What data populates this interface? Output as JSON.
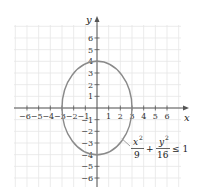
{
  "chart_data": {
    "type": "line",
    "title": "",
    "xlabel": "x",
    "ylabel": "y",
    "xlim": [
      -6.5,
      7
    ],
    "ylim": [
      -7,
      7
    ],
    "grid": true,
    "x_ticks": [
      -6,
      -5,
      -4,
      -3,
      -2,
      -1,
      1,
      2,
      3,
      4,
      5,
      6
    ],
    "y_ticks": [
      -6,
      -5,
      -4,
      -3,
      -2,
      -1,
      1,
      2,
      3,
      4,
      5,
      6
    ],
    "x_tick_labels": [
      "−6",
      "−5",
      "−4",
      "−3",
      "−2",
      "−1",
      "1",
      "2",
      "3",
      "4",
      "5",
      "6"
    ],
    "y_tick_labels": [
      "−6",
      "−5",
      "−4",
      "−3",
      "−2",
      "−1",
      "1",
      "2",
      "3",
      "4",
      "5",
      "6"
    ],
    "series": [
      {
        "name": "ellipse boundary",
        "shape": "ellipse",
        "center": [
          0,
          0
        ],
        "semi_axis_x": 3,
        "semi_axis_y": 4,
        "color": "#8a8a8a"
      }
    ],
    "annotations": [
      {
        "text": "x^2/9 + y^2/16 ≤ 1",
        "points_to": [
          2.2,
          -2.7
        ]
      }
    ]
  },
  "labels": {
    "x_axis": "x",
    "y_axis": "y",
    "eq_num1": "x",
    "eq_exp1": "2",
    "eq_den1": "9",
    "eq_plus": "+",
    "eq_num2": "y",
    "eq_exp2": "2",
    "eq_den2": "16",
    "eq_rel": "≤ 1"
  },
  "colors": {
    "grid": "#e6e6e6",
    "axis": "#555555",
    "ellipse": "#8a8a8a"
  }
}
